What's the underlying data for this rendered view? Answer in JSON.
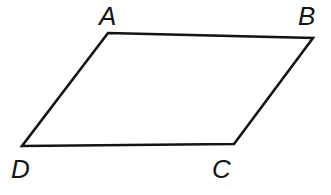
{
  "figure": {
    "name": "parallelogram-abcd",
    "shape_type": "parallelogram",
    "background_color": "#ffffff",
    "stroke_color": "#141414",
    "stroke_width": 2.6,
    "fill_color": "none",
    "canvas": {
      "width": 331,
      "height": 195
    },
    "vertices": [
      {
        "id": "A",
        "label": "A",
        "x": 108,
        "y": 33,
        "label_x": 99,
        "label_y": 3
      },
      {
        "id": "B",
        "label": "B",
        "x": 313,
        "y": 38,
        "label_x": 298,
        "label_y": 3
      },
      {
        "id": "C",
        "label": "C",
        "x": 234,
        "y": 144,
        "label_x": 212,
        "label_y": 156
      },
      {
        "id": "D",
        "label": "D",
        "x": 22,
        "y": 146,
        "label_x": 11,
        "label_y": 156
      }
    ],
    "edges": [
      {
        "id": "AB",
        "from": "A",
        "to": "B"
      },
      {
        "id": "BC",
        "from": "B",
        "to": "C"
      },
      {
        "id": "CD",
        "from": "C",
        "to": "D"
      },
      {
        "id": "DA",
        "from": "D",
        "to": "A"
      }
    ],
    "path_d": "M 108 33 L 313 38 L 234 144 L 22 146 Z"
  }
}
